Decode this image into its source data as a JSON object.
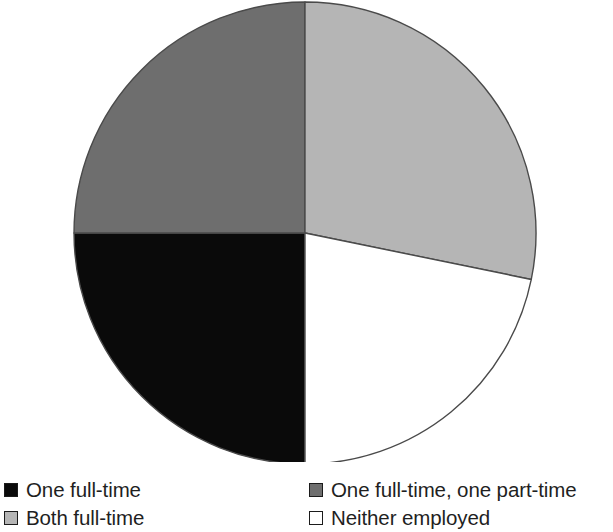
{
  "chart_data": {
    "type": "pie",
    "title": "",
    "subtitle": "",
    "xlabel": "",
    "ylabel": "",
    "grid": false,
    "legend_position": "bottom",
    "legend_columns": 2,
    "start_angle_deg": 0,
    "direction": "clockwise",
    "categories": [
      "One full-time",
      "One full-time, one part-time",
      "Both full-time",
      "Neither employed"
    ],
    "values": [
      25,
      25,
      28,
      22
    ],
    "slices": [
      {
        "label": "One full-time",
        "value": 25,
        "color": "#0a0a0a",
        "start_deg": 180,
        "end_deg": 270,
        "legend_row": 1,
        "legend_column": 1
      },
      {
        "label": "One full-time, one part-time",
        "value": 25,
        "color": "#6e6e6e",
        "start_deg": 270,
        "end_deg": 360,
        "legend_row": 1,
        "legend_column": 2
      },
      {
        "label": "Both full-time",
        "value": 28,
        "color": "#b5b5b5",
        "start_deg": 0,
        "end_deg": 101.6,
        "legend_row": 2,
        "legend_column": 1
      },
      {
        "label": "Neither employed",
        "value": 22,
        "color": "#ffffff",
        "start_deg": 101.6,
        "end_deg": 180,
        "legend_row": 2,
        "legend_column": 2
      }
    ],
    "geometry": {
      "center_x": 305,
      "center_y": 233,
      "radius": 231,
      "outline_color": "#4a4a4a",
      "outline_width": 1.4
    }
  },
  "legend": {
    "items": [
      {
        "label": "One full-time",
        "swatch": "#0a0a0a",
        "icon": "legend-swatch-icon"
      },
      {
        "label": "One full-time, one part-time",
        "swatch": "#6e6e6e",
        "icon": "legend-swatch-icon"
      },
      {
        "label": "Both full-time",
        "swatch": "#b5b5b5",
        "icon": "legend-swatch-icon"
      },
      {
        "label": "Neither employed",
        "swatch": "#ffffff",
        "icon": "legend-swatch-icon"
      }
    ]
  }
}
